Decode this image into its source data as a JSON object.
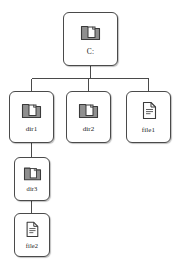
{
  "diagram": {
    "background_color": "#ffffff",
    "node_border_color": "#4a4a4a",
    "node_fill_color": "#ffffff",
    "edge_color": "#4a4a4a",
    "label_color": "#1a1a1a",
    "folder_icon_color": "#8a8a8a",
    "folder_icon_outline": "#3a3a3a",
    "file_icon_fill": "#fdfdfd",
    "file_icon_outline": "#3a3a3a",
    "file_icon_line_color": "#6a6a6a"
  },
  "nodes": [
    {
      "id": "c",
      "label": "C:",
      "icon": "folder-icon",
      "level": 0
    },
    {
      "id": "dir1",
      "label": "dir1",
      "icon": "folder-icon",
      "level": 1
    },
    {
      "id": "dir2",
      "label": "dir2",
      "icon": "folder-icon",
      "level": 1
    },
    {
      "id": "file1",
      "label": "file1",
      "icon": "file-icon",
      "level": 1
    },
    {
      "id": "dir3",
      "label": "dir3",
      "icon": "folder-icon",
      "level": 2
    },
    {
      "id": "file2",
      "label": "file2",
      "icon": "file-icon",
      "level": 3
    }
  ],
  "edges": [
    {
      "from": "c",
      "to": "dir1"
    },
    {
      "from": "c",
      "to": "dir2"
    },
    {
      "from": "c",
      "to": "file1"
    },
    {
      "from": "dir1",
      "to": "dir3"
    },
    {
      "from": "dir3",
      "to": "file2"
    }
  ]
}
